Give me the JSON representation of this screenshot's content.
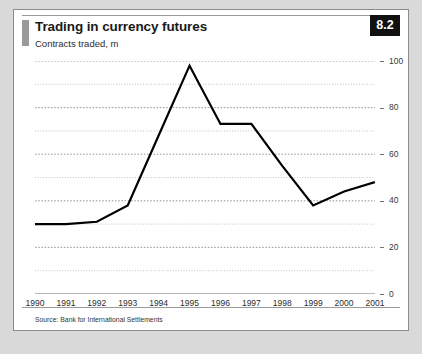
{
  "figure": {
    "badge": "8.2",
    "title": "Trading in currency futures",
    "subtitle": "Contracts traded, m",
    "source": "Source: Bank for International Settlements"
  },
  "chart_data": {
    "type": "line",
    "title": "Trading in currency futures",
    "subtitle": "Contracts traded, m",
    "xlabel": "",
    "ylabel": "Contracts traded, m",
    "categories": [
      "1990",
      "1991",
      "1992",
      "1993",
      "1994",
      "1995",
      "1996",
      "1997",
      "1998",
      "1999",
      "2000",
      "2001"
    ],
    "values": [
      30,
      30,
      31,
      38,
      68,
      98,
      73,
      73,
      55,
      38,
      44,
      48
    ],
    "ylim": [
      0,
      100
    ],
    "yticks": [
      0,
      20,
      40,
      60,
      80,
      100
    ],
    "yticklabels": [
      "0",
      "20",
      "40",
      "60",
      "80",
      "100"
    ],
    "minor_gridlines": [
      10,
      30,
      50,
      70,
      90
    ],
    "grid": true,
    "legend": false,
    "line_color": "#000000",
    "line_width": 2.2
  }
}
